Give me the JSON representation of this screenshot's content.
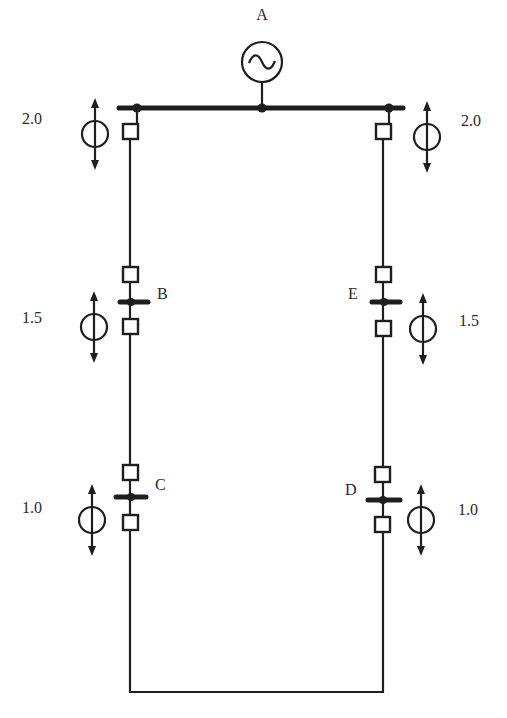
{
  "diagram": {
    "type": "single-line power system ring network",
    "generator": {
      "label": "A",
      "icon": "ac-generator-icon"
    },
    "nodes": [
      {
        "id": "B",
        "label": "B",
        "side": "left"
      },
      {
        "id": "C",
        "label": "C",
        "side": "left"
      },
      {
        "id": "D",
        "label": "D",
        "side": "right"
      },
      {
        "id": "E",
        "label": "E",
        "side": "right"
      }
    ],
    "current_sources": [
      {
        "location": "A-left",
        "value": "2.0",
        "icon": "current-source-icon"
      },
      {
        "location": "A-right",
        "value": "2.0",
        "icon": "current-source-icon"
      },
      {
        "location": "B",
        "value": "1.5",
        "icon": "current-source-icon"
      },
      {
        "location": "E",
        "value": "1.5",
        "icon": "current-source-icon"
      },
      {
        "location": "C",
        "value": "1.0",
        "icon": "current-source-icon"
      },
      {
        "location": "D",
        "value": "1.0",
        "icon": "current-source-icon"
      }
    ],
    "breaker_icon": "circuit-breaker-icon",
    "colors": {
      "line": "#1e1e1e",
      "background": "#ffffff",
      "text": "#2a2a2a"
    }
  }
}
